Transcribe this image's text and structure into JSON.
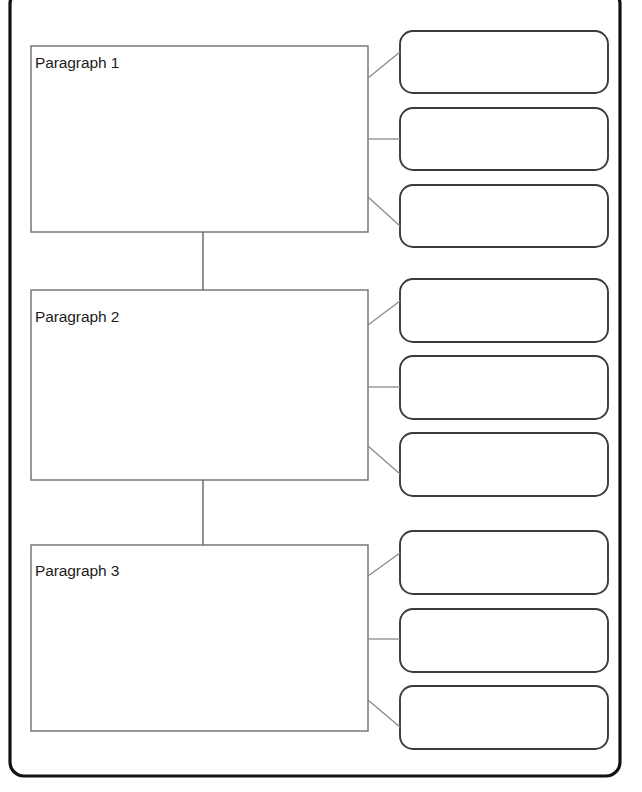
{
  "page": {
    "background_color": "#ffffff"
  },
  "frame": {
    "name": "worksheet-frame",
    "stroke_color": "#111111",
    "x": 10,
    "y": -10,
    "width": 610,
    "height": 786,
    "corner_radius": 14
  },
  "colors": {
    "main_box_stroke": "#6e6e6e",
    "detail_box_stroke": "#3b3b3b",
    "connector_stroke": "#8a8a8a",
    "frame_stroke": "#111111",
    "box_fill": "#ffffff",
    "text": "#1c1c1c"
  },
  "sections": [
    {
      "id": "section-1",
      "main_box": {
        "label": "Paragraph 1",
        "value": "",
        "placeholder": "",
        "x": 31,
        "y": 46,
        "width": 337,
        "height": 186
      },
      "detail_boxes": [
        {
          "label": "",
          "value": "",
          "x": 400,
          "y": 31,
          "width": 208,
          "height": 62,
          "corner_radius": 13
        },
        {
          "label": "",
          "value": "",
          "x": 400,
          "y": 108,
          "width": 208,
          "height": 62,
          "corner_radius": 13
        },
        {
          "label": "",
          "value": "",
          "x": 400,
          "y": 185,
          "width": 208,
          "height": 62,
          "corner_radius": 13
        }
      ]
    },
    {
      "id": "section-2",
      "main_box": {
        "label": "Paragraph 2",
        "value": "",
        "placeholder": "",
        "x": 31,
        "y": 290,
        "width": 337,
        "height": 190
      },
      "detail_boxes": [
        {
          "label": "",
          "value": "",
          "x": 400,
          "y": 279,
          "width": 208,
          "height": 63,
          "corner_radius": 13
        },
        {
          "label": "",
          "value": "",
          "x": 400,
          "y": 356,
          "width": 208,
          "height": 63,
          "corner_radius": 13
        },
        {
          "label": "",
          "value": "",
          "x": 400,
          "y": 433,
          "width": 208,
          "height": 63,
          "corner_radius": 13
        }
      ]
    },
    {
      "id": "section-3",
      "main_box": {
        "label": "Paragraph 3",
        "value": "",
        "placeholder": "",
        "x": 31,
        "y": 545,
        "width": 337,
        "height": 186
      },
      "detail_boxes": [
        {
          "label": "",
          "value": "",
          "x": 400,
          "y": 531,
          "width": 208,
          "height": 63,
          "corner_radius": 13
        },
        {
          "label": "",
          "value": "",
          "x": 400,
          "y": 609,
          "width": 208,
          "height": 63,
          "corner_radius": 13
        },
        {
          "label": "",
          "value": "",
          "x": 400,
          "y": 686,
          "width": 208,
          "height": 63,
          "corner_radius": 13
        }
      ]
    }
  ],
  "spines": [
    {
      "name": "spine-1-to-2",
      "x": 203,
      "y1": 232,
      "y2": 290
    },
    {
      "name": "spine-2-to-3",
      "x": 203,
      "y1": 480,
      "y2": 545
    }
  ]
}
